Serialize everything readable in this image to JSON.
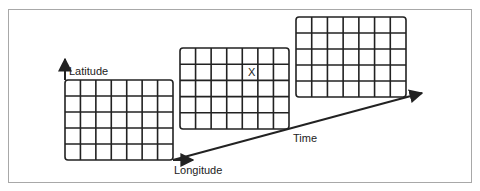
{
  "diagram": {
    "title": "",
    "frame": {
      "border_color": "#a8a8a8"
    },
    "axes": {
      "latitude_label": "Latitude",
      "longitude_label": "Longitude",
      "time_label": "Time"
    },
    "grids": [
      {
        "name": "grid-t1",
        "cols": 7,
        "rows": 5,
        "x": 65,
        "y": 80,
        "w": 108,
        "h": 80
      },
      {
        "name": "grid-t2",
        "cols": 7,
        "rows": 5,
        "x": 180,
        "y": 48,
        "w": 109,
        "h": 81
      },
      {
        "name": "grid-t3",
        "cols": 7,
        "rows": 5,
        "x": 296,
        "y": 17,
        "w": 110,
        "h": 80
      }
    ],
    "marker": {
      "text": "X",
      "grid": 2,
      "row": 2,
      "col": 5
    },
    "line_color": "#222222"
  }
}
